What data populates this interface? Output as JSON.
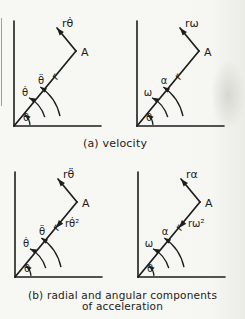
{
  "figure": {
    "background": "#f6f6f2",
    "ink": "#1d1d1b"
  },
  "captions": {
    "a": "(a) velocity",
    "b_line1": "(b) radial and angular components",
    "b_line2": "of acceleration"
  },
  "diagrams": [
    {
      "name": "velocity-general-notation",
      "tangential_vector": "rθ̇",
      "point": "A",
      "radius": "r",
      "angular_outer": "θ̈",
      "angular_inner": "θ̇",
      "angle": "θ",
      "radial_vector": ""
    },
    {
      "name": "velocity-omega-notation",
      "tangential_vector": "rω",
      "point": "A",
      "radius": "r",
      "angular_outer": "α",
      "angular_inner": "ω",
      "angle": "θ",
      "radial_vector": ""
    },
    {
      "name": "acceleration-general-notation",
      "tangential_vector": "rθ̈",
      "point": "A",
      "radius": "r",
      "angular_outer": "θ̈",
      "angular_inner": "θ̇",
      "angle": "θ",
      "radial_vector": "rθ̇²"
    },
    {
      "name": "acceleration-omega-notation",
      "tangential_vector": "rα",
      "point": "A",
      "radius": "r",
      "angular_outer": "α",
      "angular_inner": "ω",
      "angle": "θ",
      "radial_vector": "rω²"
    }
  ]
}
